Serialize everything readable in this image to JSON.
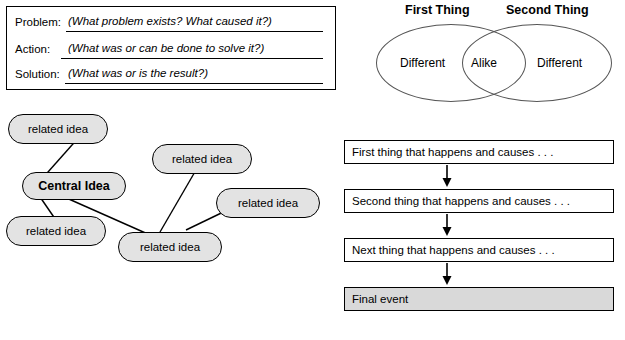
{
  "problem_solution_box": {
    "rows": [
      {
        "label": "Problem:",
        "fill": "(What problem exists?  What caused it?)"
      },
      {
        "label": "Action:",
        "fill": "(What was or can be done to solve it?)"
      },
      {
        "label": "Solution:",
        "fill": "(What was or is the result?)"
      }
    ]
  },
  "venn": {
    "title_left": "First Thing",
    "title_right": "Second Thing",
    "left_label": "Different",
    "center_label": "Alike",
    "right_label": "Different"
  },
  "web": {
    "central": "Central Idea",
    "nodes": [
      "related idea",
      "related idea",
      "related idea",
      "related idea",
      "related idea"
    ]
  },
  "flow": {
    "steps": [
      "First thing that happens and causes . . .",
      "Second thing that happens and causes . . .",
      "Next thing that happens and causes . . .",
      "Final event"
    ]
  },
  "colors": {
    "node_fill": "#e3e3e3",
    "final_event_fill": "#d9d9d9",
    "line": "#000000"
  }
}
